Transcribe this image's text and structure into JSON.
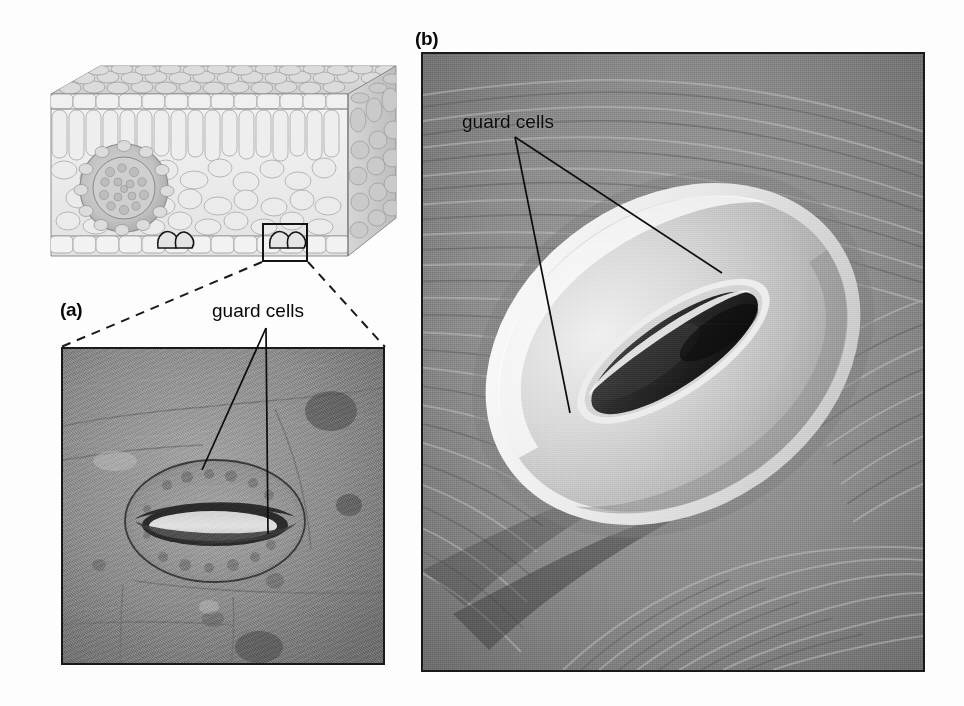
{
  "figure": {
    "background_color": "#fdfdfd",
    "panels": [
      {
        "id": "overview",
        "letter": "",
        "type": "diagram",
        "description": "three-dimensional cut-away block diagram of a leaf"
      },
      {
        "id": "a",
        "letter": "(a)",
        "type": "light-micrograph",
        "description": "surface view light micrograph of a single stoma"
      },
      {
        "id": "b",
        "letter": "(b)",
        "type": "scanning-electron-micrograph",
        "description": "scanning electron micrograph of a stoma on the leaf surface"
      }
    ]
  },
  "leaf_block": {
    "label": "leaf cross-section block",
    "layers": [
      "upper epidermis",
      "palisade mesophyll",
      "spongy mesophyll",
      "vascular bundle",
      "lower epidermis"
    ],
    "stomata_count": 2,
    "inset_box": {
      "label": "magnified region",
      "stroke_color": "#141414"
    }
  },
  "panel_a": {
    "letter": "(a)",
    "callout": "guard cells",
    "leader_lines": 2,
    "frame_color": "#1a1a1a",
    "base_tone": "#8e8e8e"
  },
  "panel_b": {
    "letter": "(b)",
    "callout": "guard cells",
    "leader_lines": 2,
    "frame_color": "#1a1a1a",
    "base_tone": "#8a8a8a"
  },
  "connectors": {
    "style": "dashed",
    "color": "#1a1a1a",
    "description": "dashed magnification lines from inset box to panel (a)"
  }
}
